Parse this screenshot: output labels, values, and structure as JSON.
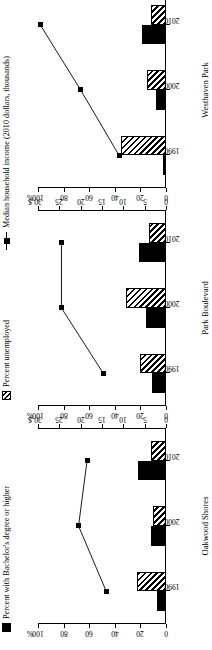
{
  "legend": {
    "items": [
      {
        "label": "Percent with Bachelor's degree or higher",
        "marker": "black-square-swatch"
      },
      {
        "label": "Percent unemployed",
        "marker": "hatched-square-swatch"
      },
      {
        "label": "Median household income (2010 dollars, thousands)",
        "marker": "line-square-marker"
      }
    ]
  },
  "axes": {
    "left": {
      "unit": "%",
      "ticks": [
        "100",
        "80",
        "60",
        "40",
        "20",
        "0"
      ]
    },
    "right": {
      "unit": "$",
      "ticks": [
        "30",
        "25",
        "20",
        "15",
        "10",
        "5",
        "0"
      ]
    }
  },
  "chart_data": {
    "type": "bar",
    "title": "",
    "xlabel": "",
    "ylabel": "Percent",
    "ylim": [
      0,
      100
    ],
    "y2label": "Median household income (2010 dollars, thousands)",
    "y2lim": [
      0,
      30
    ],
    "grid": false,
    "legend_position": "top",
    "categories": [
      "1990",
      "2000",
      "2010"
    ],
    "panels": [
      {
        "name": "Oakwood Shores",
        "series": [
          {
            "name": "Percent with Bachelor's degree or higher",
            "type": "bar",
            "style": "black",
            "axis": "left",
            "values": [
              7,
              12,
              22
            ]
          },
          {
            "name": "Percent unemployed",
            "type": "bar",
            "style": "hatched",
            "axis": "left",
            "values": [
              23,
              10,
              12
            ]
          },
          {
            "name": "Median household income (2010 dollars, thousands)",
            "type": "line",
            "axis": "right",
            "values": [
              14.0,
              20.5,
              18.5
            ]
          }
        ]
      },
      {
        "name": "Park Boulevard",
        "series": [
          {
            "name": "Percent with Bachelor's degree or higher",
            "type": "bar",
            "style": "black",
            "axis": "left",
            "values": [
              11,
              16,
              21
            ]
          },
          {
            "name": "Percent unemployed",
            "type": "bar",
            "style": "hatched",
            "axis": "left",
            "values": [
              20,
              31,
              13
            ]
          },
          {
            "name": "Median household income (2010 dollars, thousands)",
            "type": "line",
            "axis": "right",
            "values": [
              14.7,
              24.5,
              24.5
            ]
          }
        ]
      },
      {
        "name": "Westhaven Park",
        "series": [
          {
            "name": "Percent with Bachelor's degree or higher",
            "type": "bar",
            "style": "black",
            "axis": "left",
            "values": [
              2,
              8,
              19
            ]
          },
          {
            "name": "Percent unemployed",
            "type": "bar",
            "style": "hatched",
            "axis": "left",
            "values": [
              35,
              15,
              12
            ]
          },
          {
            "name": "Median household income (2010 dollars, thousands)",
            "type": "line",
            "axis": "right",
            "values": [
              11.0,
              20.0,
              29.5
            ]
          }
        ]
      }
    ]
  }
}
